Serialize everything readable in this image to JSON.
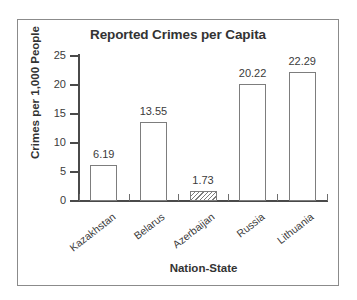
{
  "chart_data": {
    "type": "bar",
    "title": "Reported Crimes per Capita",
    "xlabel": "Nation-State",
    "ylabel": "Crimes per 1,000 People",
    "categories": [
      "Kazakhstan",
      "Belarus",
      "Azerbaijan",
      "Russia",
      "Lithuania"
    ],
    "values": [
      6.19,
      13.55,
      1.73,
      20.22,
      22.29
    ],
    "value_labels": [
      "6.19",
      "13.55",
      "1.73",
      "20.22",
      "22.29"
    ],
    "bar_styles": [
      "open",
      "open",
      "hatched",
      "open",
      "open"
    ],
    "ylim": [
      0,
      25
    ],
    "yticks": [
      0,
      5,
      10,
      15,
      20,
      25
    ],
    "ytick_labels": [
      "0",
      "5",
      "10",
      "15",
      "20",
      "25"
    ],
    "grid": false,
    "legend": "none",
    "colors": {
      "bar_fill": "#ffffff",
      "bar_stroke": "#7d7d7d",
      "axis": "#4a4a4a",
      "text": "#3b3b3b",
      "frame": "#8b8b8b",
      "background": "#ffffff"
    }
  }
}
